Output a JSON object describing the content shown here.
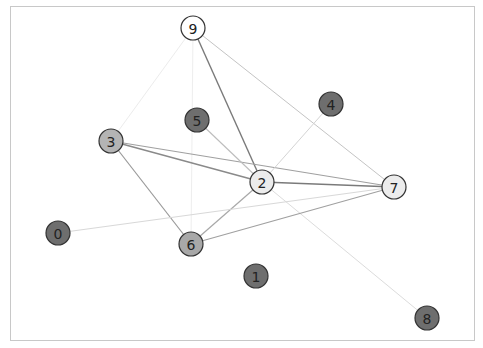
{
  "graph": {
    "frame": {
      "x": 10,
      "y": 6,
      "width": 464,
      "height": 334,
      "stroke": "#c8c8c8"
    },
    "node_radius": 12,
    "nodes": [
      {
        "id": "0",
        "label": "0",
        "x": 58,
        "y": 233,
        "fill": "#6e6e6e"
      },
      {
        "id": "1",
        "label": "1",
        "x": 256,
        "y": 276,
        "fill": "#6e6e6e"
      },
      {
        "id": "2",
        "label": "2",
        "x": 262,
        "y": 182,
        "fill": "#ececec"
      },
      {
        "id": "3",
        "label": "3",
        "x": 111,
        "y": 141,
        "fill": "#b4b4b4"
      },
      {
        "id": "4",
        "label": "4",
        "x": 331,
        "y": 104,
        "fill": "#6e6e6e"
      },
      {
        "id": "5",
        "label": "5",
        "x": 197,
        "y": 120,
        "fill": "#6e6e6e"
      },
      {
        "id": "6",
        "label": "6",
        "x": 191,
        "y": 244,
        "fill": "#a8a8a8"
      },
      {
        "id": "7",
        "label": "7",
        "x": 394,
        "y": 187,
        "fill": "#ececec"
      },
      {
        "id": "8",
        "label": "8",
        "x": 427,
        "y": 318,
        "fill": "#6e6e6e"
      },
      {
        "id": "9",
        "label": "9",
        "x": 193,
        "y": 28,
        "fill": "#ffffff"
      }
    ],
    "edges": [
      {
        "source": "9",
        "target": "2",
        "color": "#7a7a7a",
        "width": 1.4
      },
      {
        "source": "9",
        "target": "7",
        "color": "#c4c4c4",
        "width": 1.0
      },
      {
        "source": "9",
        "target": "3",
        "color": "#ececec",
        "width": 1.0
      },
      {
        "source": "9",
        "target": "6",
        "color": "#eeeeee",
        "width": 1.0
      },
      {
        "source": "3",
        "target": "7",
        "color": "#a0a0a0",
        "width": 1.2
      },
      {
        "source": "3",
        "target": "2",
        "color": "#8a8a8a",
        "width": 1.4
      },
      {
        "source": "3",
        "target": "6",
        "color": "#999999",
        "width": 1.2
      },
      {
        "source": "5",
        "target": "2",
        "color": "#bdbdbd",
        "width": 1.1
      },
      {
        "source": "4",
        "target": "2",
        "color": "#d4d4d4",
        "width": 1.0
      },
      {
        "source": "2",
        "target": "7",
        "color": "#7a7a7a",
        "width": 1.5
      },
      {
        "source": "2",
        "target": "6",
        "color": "#a8a8a8",
        "width": 1.2
      },
      {
        "source": "2",
        "target": "8",
        "color": "#dcdcdc",
        "width": 1.0
      },
      {
        "source": "6",
        "target": "7",
        "color": "#a0a0a0",
        "width": 1.2
      },
      {
        "source": "0",
        "target": "7",
        "color": "#d8d8d8",
        "width": 1.0
      }
    ]
  }
}
